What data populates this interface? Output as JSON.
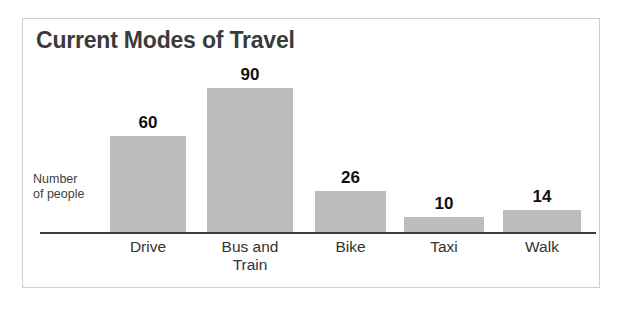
{
  "figure": {
    "title": "Current Modes of Travel",
    "y_axis_label_line1": "Number",
    "y_axis_label_line2": "of people",
    "bar_color": "#bdbdbd",
    "axis_color": "#3b3b3b",
    "title_color": "#3b3b3b",
    "frame_color": "#cfcfcf",
    "background": "#ffffff"
  },
  "chart_data": {
    "type": "bar",
    "title": "Current Modes of Travel",
    "xlabel": "",
    "ylabel": "Number of people",
    "categories": [
      "Drive",
      "Bus and Train",
      "Bike",
      "Taxi",
      "Walk"
    ],
    "category_lines": [
      [
        "Drive"
      ],
      [
        "Bus and",
        "Train"
      ],
      [
        "Bike"
      ],
      [
        "Taxi"
      ],
      [
        "Walk"
      ]
    ],
    "values": [
      60,
      90,
      26,
      10,
      14
    ],
    "value_labels": [
      "60",
      "90",
      "26",
      "10",
      "14"
    ],
    "ylim": [
      0,
      90
    ],
    "grid": false,
    "legend": false,
    "axis_ticks_shown": false,
    "series": [
      {
        "name": "Number of people",
        "values": [
          60,
          90,
          26,
          10,
          14
        ]
      }
    ]
  }
}
